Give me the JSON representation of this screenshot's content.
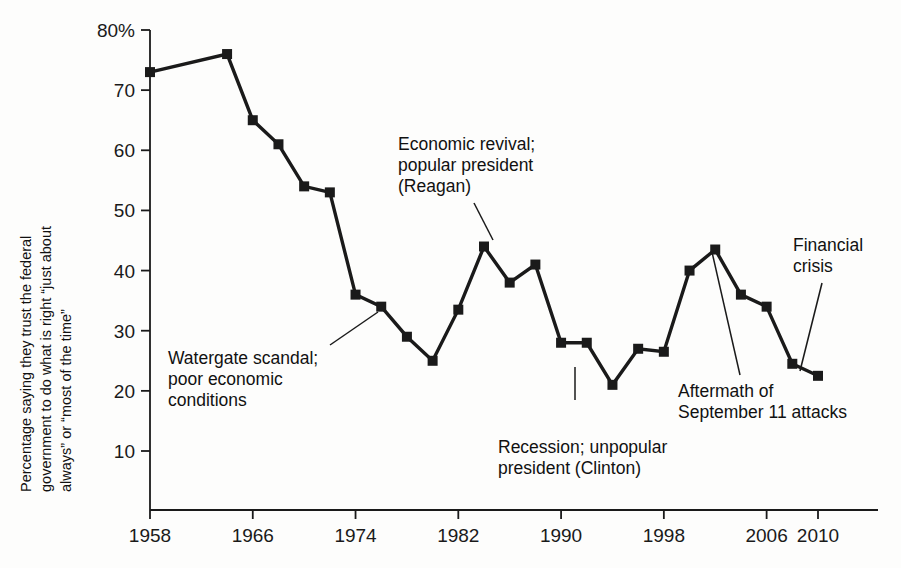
{
  "figure": {
    "page_bleed_text": "scanned page bleed-through",
    "ylabel": "Percentage saying they trust the federal\ngovernment to do what is right “just about\nalways” or “most of the time”",
    "line_color": "#1a1a1a",
    "marker_color": "#1a1a1a",
    "axis_color": "#1a1a1a"
  },
  "annotations": [
    {
      "name": "annotation-watergate",
      "text": "Watergate scandal;\npoor economic\nconditions",
      "x": 168,
      "y": 348,
      "leader": {
        "x1": 330,
        "y1": 345,
        "x2": 378,
        "y2": 312
      }
    },
    {
      "name": "annotation-reagan",
      "text": "Economic revival;\npopular president\n(Reagan)",
      "x": 398,
      "y": 134,
      "leader": {
        "x1": 474,
        "y1": 203,
        "x2": 493,
        "y2": 240
      }
    },
    {
      "name": "annotation-clinton",
      "text": "Recession; unpopular\npresident (Clinton)",
      "x": 498,
      "y": 437,
      "leader": {
        "x1": 575,
        "y1": 400,
        "x2": 575,
        "y2": 367
      }
    },
    {
      "name": "annotation-september-11",
      "text": "Aftermath of\nSeptember 11 attacks",
      "x": 678,
      "y": 381,
      "leader": {
        "x1": 740,
        "y1": 375,
        "x2": 712,
        "y2": 252
      }
    },
    {
      "name": "annotation-financial-crisis",
      "text": "Financial\ncrisis",
      "x": 793,
      "y": 235,
      "leader": {
        "x1": 822,
        "y1": 283,
        "x2": 800,
        "y2": 371
      }
    }
  ],
  "chart_data": {
    "type": "line",
    "title": "",
    "xlabel": "",
    "ylabel": "Percentage saying they trust the federal government to do what is right “just about always” or “most of the time”",
    "xlim": [
      1956,
      2012
    ],
    "ylim": [
      0,
      80
    ],
    "yticks": [
      10,
      20,
      30,
      40,
      50,
      60,
      70,
      80
    ],
    "ytick_labels": [
      "10",
      "20",
      "30",
      "40",
      "50",
      "60",
      "70",
      "80%"
    ],
    "xticks": [
      1958,
      1966,
      1974,
      1982,
      1990,
      1998,
      2006,
      2010
    ],
    "xtick_labels": [
      "1958",
      "1966",
      "1974",
      "1982",
      "1990",
      "1998",
      "2006",
      "2010"
    ],
    "grid": false,
    "legend": null,
    "markers": "square",
    "series": [
      {
        "name": "Trust in federal government",
        "x": [
          1958,
          1964,
          1966,
          1968,
          1970,
          1972,
          1974,
          1976,
          1978,
          1980,
          1982,
          1984,
          1986,
          1988,
          1990,
          1992,
          1994,
          1996,
          1998,
          2000,
          2002,
          2004,
          2006,
          2008,
          2010
        ],
        "values": [
          73,
          76,
          65,
          61,
          54,
          53,
          36,
          34,
          29,
          25,
          33.5,
          44,
          38,
          41,
          28,
          28,
          21,
          27,
          26.5,
          40,
          43.5,
          36,
          34,
          24.5,
          22.5
        ]
      }
    ]
  }
}
